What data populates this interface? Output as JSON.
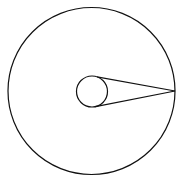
{
  "diagram": {
    "stroke_color": "#111111",
    "background": "#ffffff",
    "outer_circle": {
      "cx": 91.5,
      "cy": 91,
      "r": 83.5
    },
    "inner_circle": {
      "cx": 92,
      "cy": 91.5,
      "r": 15.5
    },
    "tangent_point": {
      "x": 175,
      "y": 91
    },
    "tangent_lines": [
      {
        "x1": 97,
        "y1": 76.8,
        "x2": 175,
        "y2": 91
      },
      {
        "x1": 95.5,
        "y1": 106.6,
        "x2": 175,
        "y2": 91
      }
    ]
  }
}
